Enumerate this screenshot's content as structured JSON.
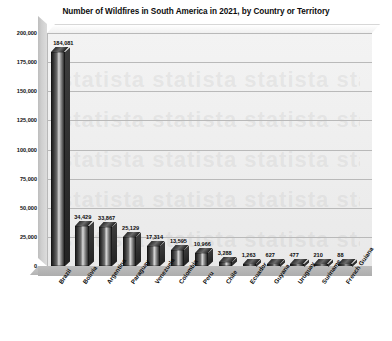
{
  "chart_data": {
    "type": "bar",
    "title": "Number of Wildfires in South America in 2021, by Country or Territory",
    "xlabel": "",
    "ylabel": "",
    "ylim": [
      0,
      200000
    ],
    "ytick_labels": [
      "200,000",
      "175,000",
      "150,000",
      "125,000",
      "100,000",
      "75,000",
      "50,000",
      "25,000",
      "0"
    ],
    "ytick_values": [
      200000,
      175000,
      150000,
      125000,
      100000,
      75000,
      50000,
      25000,
      0
    ],
    "grid": true,
    "legend": "none",
    "style": "3d-column",
    "categories": [
      "Brazil",
      "Bolivia",
      "Argentina",
      "Paraguay",
      "Venezuela",
      "Colombia",
      "Peru",
      "Chile",
      "Ecuador",
      "Guyana",
      "Uruguay",
      "Suriname",
      "French Guiana"
    ],
    "values": [
      184081,
      34429,
      33867,
      25129,
      17314,
      13595,
      10966,
      3288,
      1263,
      627,
      477,
      210,
      88
    ],
    "data_labels": [
      "184,081",
      "34,429",
      "33,867",
      "25,129",
      "17,314",
      "13,595",
      "10,966",
      "3,288",
      "1,263",
      "627",
      "477",
      "210",
      "88"
    ],
    "colors": {
      "bar_dark": "#1b1b1b",
      "bar_highlight": "#d9d9d9",
      "plot_background": "#eeeeee",
      "floor": "#b4b4b4",
      "gridline": "#b9b9b9",
      "text": "#0b0b0b"
    }
  },
  "watermark": "statista"
}
